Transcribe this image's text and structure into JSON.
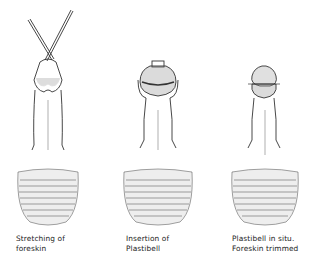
{
  "figure": {
    "panels": [
      {
        "id": "stretching",
        "caption_lines": [
          "Stretching of",
          "foreskin"
        ],
        "instrument": "forceps"
      },
      {
        "id": "insertion",
        "caption_lines": [
          "Insertion of",
          "Plastibell"
        ],
        "instrument": "plastibell"
      },
      {
        "id": "in-situ",
        "caption_lines": [
          "Plastibell in situ.",
          "Foreskin trimmed"
        ],
        "instrument": "plastibell-ligature"
      }
    ],
    "colors": {
      "ink": "#222222",
      "shade": "#555555",
      "background": "#ffffff"
    }
  }
}
